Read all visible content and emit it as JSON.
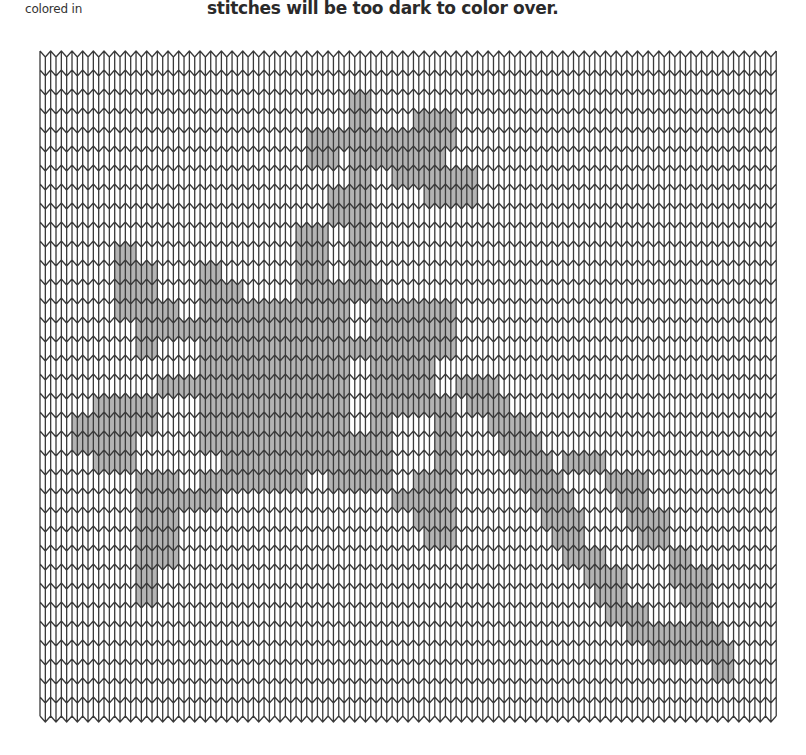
{
  "captions": {
    "left": "colored in",
    "right": "stitches will be too dark to color over."
  },
  "chart": {
    "type": "knitting-stitch-chart",
    "columns": 69,
    "rows": 35,
    "origin_x": 40,
    "origin_y": 57,
    "stitch_width": 10.67,
    "row_height": 19.0,
    "v_depth": 6,
    "line_color": "#3a3a3a",
    "fill_color": "#b3b3b3",
    "background": "#ffffff",
    "shaded_runs": [
      [
        2,
        29,
        31
      ],
      [
        3,
        29,
        31
      ],
      [
        3,
        35,
        39
      ],
      [
        4,
        25,
        39
      ],
      [
        5,
        25,
        28
      ],
      [
        5,
        29,
        38
      ],
      [
        6,
        29,
        31
      ],
      [
        6,
        33,
        41
      ],
      [
        7,
        27,
        31
      ],
      [
        7,
        36,
        41
      ],
      [
        8,
        27,
        31
      ],
      [
        9,
        24,
        27
      ],
      [
        9,
        29,
        31
      ],
      [
        10,
        7,
        9
      ],
      [
        10,
        24,
        27
      ],
      [
        10,
        29,
        31
      ],
      [
        11,
        7,
        11
      ],
      [
        11,
        15,
        17
      ],
      [
        11,
        24,
        27
      ],
      [
        11,
        29,
        31
      ],
      [
        12,
        7,
        11
      ],
      [
        12,
        15,
        19
      ],
      [
        12,
        24,
        32
      ],
      [
        13,
        7,
        13
      ],
      [
        13,
        15,
        29
      ],
      [
        13,
        31,
        39
      ],
      [
        14,
        9,
        15
      ],
      [
        14,
        15,
        29
      ],
      [
        14,
        31,
        39
      ],
      [
        15,
        9,
        11
      ],
      [
        15,
        15,
        39
      ],
      [
        16,
        15,
        29
      ],
      [
        16,
        31,
        37
      ],
      [
        17,
        11,
        29
      ],
      [
        17,
        31,
        37
      ],
      [
        17,
        39,
        43
      ],
      [
        18,
        5,
        11
      ],
      [
        18,
        15,
        29
      ],
      [
        18,
        31,
        39
      ],
      [
        18,
        40,
        44
      ],
      [
        19,
        3,
        11
      ],
      [
        19,
        15,
        29
      ],
      [
        19,
        31,
        33
      ],
      [
        19,
        37,
        39
      ],
      [
        19,
        42,
        46
      ],
      [
        20,
        3,
        9
      ],
      [
        20,
        15,
        33
      ],
      [
        20,
        37,
        39
      ],
      [
        20,
        43,
        47
      ],
      [
        21,
        5,
        9
      ],
      [
        21,
        17,
        33
      ],
      [
        21,
        37,
        39
      ],
      [
        21,
        44,
        48
      ],
      [
        21,
        49,
        53
      ],
      [
        22,
        9,
        13
      ],
      [
        22,
        15,
        25
      ],
      [
        22,
        27,
        33
      ],
      [
        22,
        35,
        39
      ],
      [
        22,
        45,
        49
      ],
      [
        22,
        53,
        57
      ],
      [
        23,
        9,
        17
      ],
      [
        23,
        33,
        39
      ],
      [
        23,
        46,
        50
      ],
      [
        23,
        54,
        57
      ],
      [
        24,
        9,
        13
      ],
      [
        24,
        35,
        39
      ],
      [
        24,
        47,
        51
      ],
      [
        24,
        55,
        59
      ],
      [
        25,
        9,
        13
      ],
      [
        25,
        36,
        39
      ],
      [
        25,
        48,
        51
      ],
      [
        25,
        56,
        59
      ],
      [
        26,
        9,
        13
      ],
      [
        26,
        49,
        53
      ],
      [
        26,
        59,
        61
      ],
      [
        27,
        9,
        11
      ],
      [
        27,
        51,
        55
      ],
      [
        27,
        59,
        63
      ],
      [
        28,
        9,
        11
      ],
      [
        28,
        52,
        55
      ],
      [
        28,
        60,
        63
      ],
      [
        29,
        53,
        57
      ],
      [
        29,
        61,
        63
      ],
      [
        30,
        55,
        61
      ],
      [
        30,
        61,
        64
      ],
      [
        31,
        57,
        63
      ],
      [
        31,
        63,
        65
      ],
      [
        32,
        63,
        65
      ]
    ]
  }
}
